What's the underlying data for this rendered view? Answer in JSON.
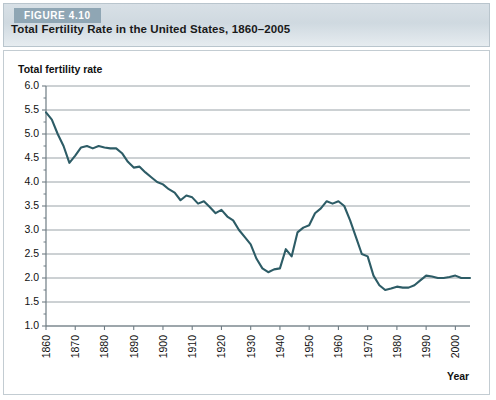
{
  "figure": {
    "tag": "FIGURE 4.10",
    "title": "Total Fertility Rate in the United States, 1860–2005"
  },
  "colors": {
    "line": "#2d5c66",
    "grid": "#9aa3a8",
    "axis": "#6f7c84",
    "tag_background": "#8fa6b4",
    "header_background": "#d3dce2",
    "plot_background": "#ffffff",
    "text": "#111111"
  },
  "axes": {
    "y_title": "Total fertility rate",
    "x_title": "Year",
    "y_ticks": [
      "1.0",
      "1.5",
      "2.0",
      "2.5",
      "3.0",
      "3.5",
      "4.0",
      "4.5",
      "5.0",
      "5.5",
      "6.0"
    ],
    "x_ticks": [
      "1860",
      "1870",
      "1880",
      "1890",
      "1900",
      "1910",
      "1920",
      "1930",
      "1940",
      "1950",
      "1960",
      "1970",
      "1980",
      "1990",
      "2000"
    ]
  },
  "chart_data": {
    "type": "line",
    "title": "Total Fertility Rate in the United States, 1860–2005",
    "xlabel": "Year",
    "ylabel": "Total fertility rate",
    "xlim": [
      1860,
      2005
    ],
    "ylim": [
      1.0,
      6.0
    ],
    "ytick_step": 0.5,
    "xtick_step": 10,
    "grid": true,
    "legend": false,
    "series": [
      {
        "name": "Total fertility rate",
        "x": [
          1860,
          1862,
          1864,
          1866,
          1868,
          1870,
          1872,
          1874,
          1876,
          1878,
          1880,
          1882,
          1884,
          1886,
          1888,
          1890,
          1892,
          1894,
          1896,
          1898,
          1900,
          1902,
          1904,
          1906,
          1908,
          1910,
          1912,
          1914,
          1916,
          1918,
          1920,
          1922,
          1924,
          1926,
          1928,
          1930,
          1932,
          1934,
          1936,
          1938,
          1940,
          1942,
          1944,
          1946,
          1948,
          1950,
          1952,
          1954,
          1956,
          1958,
          1960,
          1962,
          1964,
          1966,
          1968,
          1970,
          1972,
          1974,
          1976,
          1978,
          1980,
          1982,
          1984,
          1986,
          1988,
          1990,
          1992,
          1994,
          1996,
          1998,
          2000,
          2002,
          2005
        ],
        "y": [
          5.45,
          5.3,
          5.0,
          4.75,
          4.4,
          4.55,
          4.72,
          4.75,
          4.7,
          4.75,
          4.72,
          4.7,
          4.7,
          4.6,
          4.42,
          4.3,
          4.32,
          4.2,
          4.1,
          4.0,
          3.95,
          3.85,
          3.78,
          3.62,
          3.72,
          3.68,
          3.55,
          3.6,
          3.48,
          3.35,
          3.42,
          3.28,
          3.2,
          3.0,
          2.85,
          2.7,
          2.4,
          2.2,
          2.12,
          2.18,
          2.2,
          2.6,
          2.45,
          2.95,
          3.05,
          3.1,
          3.35,
          3.45,
          3.6,
          3.55,
          3.6,
          3.5,
          3.2,
          2.85,
          2.5,
          2.45,
          2.05,
          1.85,
          1.75,
          1.78,
          1.82,
          1.8,
          1.8,
          1.85,
          1.95,
          2.05,
          2.03,
          2.0,
          2.0,
          2.02,
          2.05,
          2.0,
          2.0
        ]
      }
    ]
  }
}
